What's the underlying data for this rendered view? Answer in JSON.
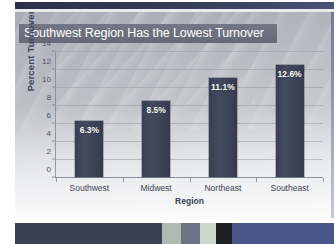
{
  "slide": {
    "title": "Southwest Region Has the Lowest Turnover",
    "title_band_color": "#6c707c",
    "title_text_color": "#ffffff",
    "background_color": "#b5b8c0"
  },
  "chart_data": {
    "type": "bar",
    "title": "Southwest Region Has the Lowest Turnover",
    "xlabel": "Region",
    "ylabel": "Percent Turnover",
    "categories": [
      "Southwest",
      "Midwest",
      "Northeast",
      "Southeast"
    ],
    "values": [
      6.3,
      8.5,
      11.1,
      12.6
    ],
    "data_labels": [
      "6.3%",
      "8.5%",
      "11.1%",
      "12.6%"
    ],
    "yticks": [
      0,
      2,
      4,
      6,
      8,
      10,
      12,
      14
    ],
    "ytick_labels": [
      "0",
      "2",
      "4",
      "6",
      "8",
      "10",
      "12",
      "14"
    ],
    "ylim": [
      0,
      14
    ],
    "grid": true,
    "legend": false,
    "bar_color": "#3e4457",
    "data_label_color": "#ffffff"
  },
  "decor": {
    "top_band_color": "#343a54",
    "right_edge_color": "#7f86a8",
    "bottom_strip": [
      {
        "name": "segment-navy",
        "color": "#3a4055",
        "width_pct": 46
      },
      {
        "name": "segment-sage",
        "color": "#aebbae",
        "width_pct": 6
      },
      {
        "name": "segment-slate",
        "color": "#6d7384",
        "width_pct": 6
      },
      {
        "name": "segment-pale-green",
        "color": "#ccd8cc",
        "width_pct": 5
      },
      {
        "name": "segment-black",
        "color": "#1f2024",
        "width_pct": 5
      },
      {
        "name": "segment-blue",
        "color": "#4a5488",
        "width_pct": 32
      }
    ]
  }
}
